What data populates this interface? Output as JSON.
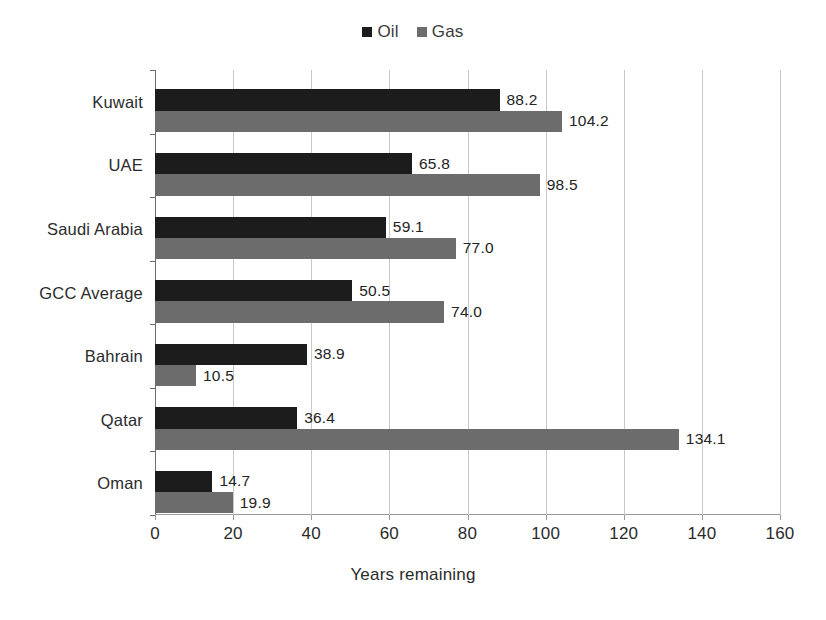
{
  "chart_data": {
    "type": "bar",
    "orientation": "horizontal",
    "title": "",
    "xlabel": "Years remaining",
    "ylabel": "",
    "xlim": [
      0,
      160
    ],
    "xticks": [
      0,
      20,
      40,
      60,
      80,
      100,
      120,
      140,
      160
    ],
    "grid": "vertical",
    "legend_position": "top-center",
    "categories": [
      "Kuwait",
      "UAE",
      "Saudi Arabia",
      "GCC Average",
      "Bahrain",
      "Qatar",
      "Oman"
    ],
    "series": [
      {
        "name": "Oil",
        "color": "#1c1c1c",
        "values": [
          88.2,
          65.8,
          59.1,
          50.5,
          38.9,
          36.4,
          14.7
        ],
        "labels": [
          "88.2",
          "65.8",
          "59.1",
          "50.5",
          "38.9",
          "36.4",
          "14.7"
        ]
      },
      {
        "name": "Gas",
        "color": "#6c6c6c",
        "values": [
          104.2,
          98.5,
          77.0,
          74.0,
          10.5,
          134.1,
          19.9
        ],
        "labels": [
          "104.2",
          "98.5",
          "77.0",
          "74.0",
          "10.5",
          "134.1",
          "19.9"
        ]
      }
    ]
  },
  "legend": {
    "entries": [
      {
        "label": "Oil",
        "color": "#1c1c1c",
        "icon": "square-swatch-icon"
      },
      {
        "label": "Gas",
        "color": "#6c6c6c",
        "icon": "square-swatch-icon"
      }
    ]
  },
  "axis": {
    "x_title": "Years remaining",
    "x_tick_labels": [
      "0",
      "20",
      "40",
      "60",
      "80",
      "100",
      "120",
      "140",
      "160"
    ]
  },
  "colors": {
    "oil": "#1c1c1c",
    "gas": "#6c6c6c",
    "gridline": "#c9c9c9",
    "axis": "#6d6d6d",
    "text": "#2b2b2b",
    "background": "#ffffff"
  }
}
